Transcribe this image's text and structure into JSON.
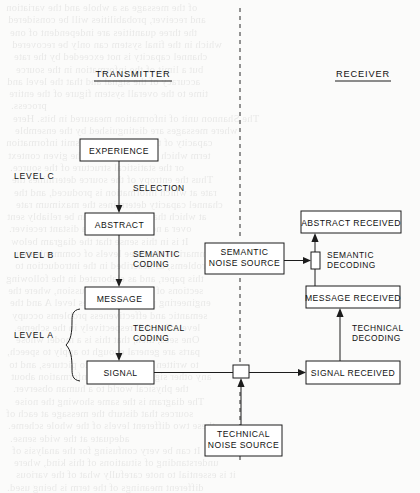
{
  "figure": {
    "headers": {
      "transmitter": "TRANSMITTER",
      "receiver": "RECEIVER"
    },
    "levels": [
      {
        "id": "level-c",
        "label": "LEVEL C"
      },
      {
        "id": "level-b",
        "label": "LEVEL B"
      },
      {
        "id": "level-a",
        "label": "LEVEL A"
      }
    ],
    "boxes": {
      "experience": "EXPERIENCE",
      "abstract": "ABSTRACT",
      "message": "MESSAGE",
      "signal": "SIGNAL",
      "abstract_received": "ABSTRACT RECEIVED",
      "message_received": "MESSAGE RECEIVED",
      "signal_received": "SIGNAL RECEIVED",
      "semantic_noise_source_line1": "SEMANTIC",
      "semantic_noise_source_line2": "NOISE SOURCE",
      "technical_noise_source_line1": "TECHNICAL",
      "technical_noise_source_line2": "NOISE SOURCE"
    },
    "arrow_labels": {
      "selection": "SELECTION",
      "semantic_coding_line1": "SEMANTIC",
      "semantic_coding_line2": "CODING",
      "technical_coding_line1": "TECHNICAL",
      "technical_coding_line2": "CODING",
      "semantic_decoding_line1": "SEMANTIC",
      "semantic_decoding_line2": "DECODING",
      "technical_decoding_line1": "TECHNICAL",
      "technical_decoding_line2": "DECODING"
    },
    "colors": {
      "ink": "#1c1c1c",
      "paper": "#fbfbfa",
      "box_fill": "#ffffff"
    },
    "bleed_through_lines": [
      "of the message as a whole and the variation",
      "and receiver, probabilities will be considered",
      "the three quantities are independent of one",
      "which in the final system can only be recovered",
      "channel capacity is not exceeded by the rate",
      "but a limit of the information in the source",
      "accuracy of the signal and that the level and",
      "time to the overall system figure of the entire",
      "process.",
      "The Shannon unit of information measured in bits. Here",
      "where messages are distinguished by the ensemble",
      "capacity of the channel to transmit information",
      "term which is appropriate to the given context",
      "or the statistical structure of the source.",
      "Thus the entropy of the source determines the",
      "rate at which information is produced, and the",
      "channel capacity determines the maximum rate",
      "at which that information can be reliably sent",
      "over a noisy channel to a distant receiver.",
      "It is in this sense that the diagram below",
      "summarizes the three levels of communication",
      "problems, as described in the introduction to",
      "this paper, and as elaborated in the following",
      "sections of the present discussion, where the",
      "engineering problem occupies level A and the",
      "semantic and effectiveness problems occupy",
      "levels B and C respectively in the scheme.",
      "One sees, then, that this is a model whose",
      "parts are general enough to apply to speech,",
      "to written text, to music, to pictures, and to",
      "any other signal conveying information about",
      "the physical world to a human observer.",
      "The diagram is the same showing the noise",
      "sources that disturb the message at each of",
      "these two different levels of the whole scheme.",
      "adequate at the wide sense.",
      "It can be very confusing for the analysis of",
      "understanding of situations of this kind, where",
      "it is essential to note carefully what of the various",
      "different meanings of the term is being used."
    ]
  }
}
